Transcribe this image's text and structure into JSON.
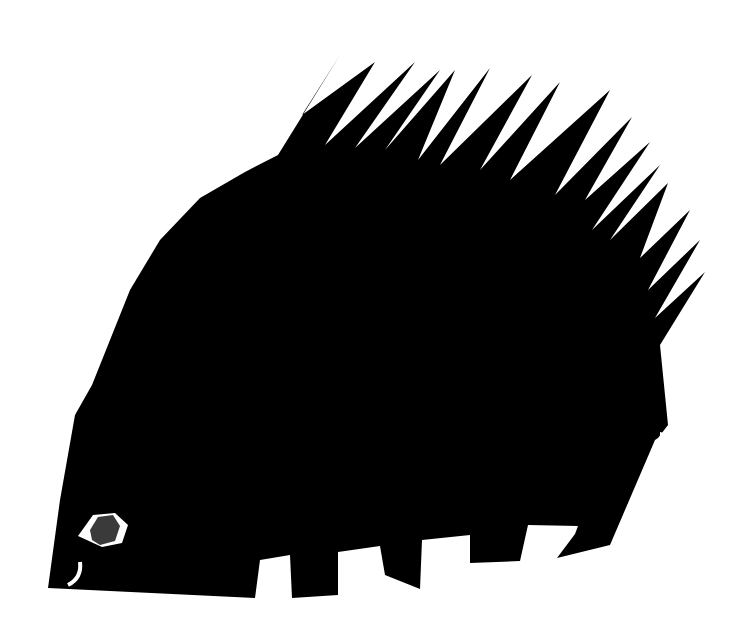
{
  "artwork": {
    "subject": "porcupine silhouette",
    "colors": {
      "background": "#ffffff",
      "body": "#000000",
      "eye_ring": "#ffffff",
      "pupil": "#3a3a3a"
    },
    "spine_count": 16,
    "leg_count": 4
  }
}
